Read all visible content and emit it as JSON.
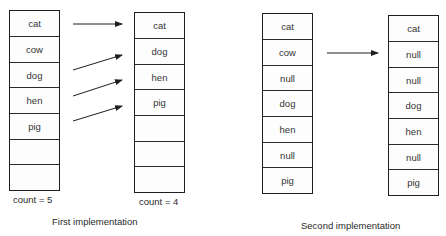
{
  "first_implementation": {
    "caption": "First implementation",
    "before": {
      "cells": [
        "cat",
        "cow",
        "dog",
        "hen",
        "pig",
        "",
        ""
      ],
      "count_label": "count = 5"
    },
    "after": {
      "cells": [
        "cat",
        "dog",
        "hen",
        "pig",
        "",
        "",
        ""
      ],
      "count_label": "count = 4"
    },
    "arrows": [
      {
        "from": "cat",
        "to": "cat"
      },
      {
        "from": "dog",
        "to": "dog"
      },
      {
        "from": "hen",
        "to": "hen"
      },
      {
        "from": "pig",
        "to": "pig"
      }
    ]
  },
  "second_implementation": {
    "caption": "Second implementation",
    "before": {
      "cells": [
        "cat",
        "cow",
        "null",
        "dog",
        "hen",
        "null",
        "pig"
      ]
    },
    "after": {
      "cells": [
        "cat",
        "null",
        "null",
        "dog",
        "hen",
        "null",
        "pig"
      ]
    },
    "arrows": [
      {
        "from": "cow",
        "to": "null"
      }
    ]
  },
  "colors": {
    "line": "#1e1e1e",
    "text": "#2a2a2a",
    "background": "#ffffff"
  }
}
